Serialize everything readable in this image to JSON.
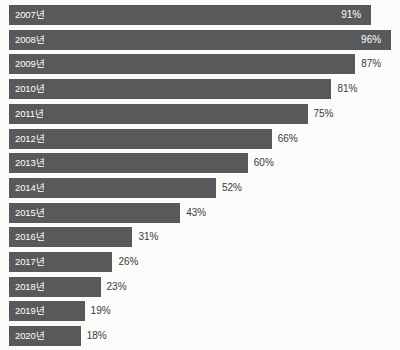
{
  "chart_data": {
    "type": "bar",
    "orientation": "horizontal",
    "title": "",
    "subtitle": "",
    "xlabel": "",
    "ylabel": "",
    "xlim": [
      0,
      100
    ],
    "grid": false,
    "legend": null,
    "legend_position": "none",
    "unit": "%",
    "bar_color": "#58595b",
    "background_color": "#fbfbfa",
    "label_text_color": "#ffffff",
    "value_text_color": "#3a3a3a",
    "categories": [
      "2007년",
      "2008년",
      "2009년",
      "2010년",
      "2011년",
      "2012년",
      "2013년",
      "2014년",
      "2015년",
      "2016년",
      "2017년",
      "2018년",
      "2019년",
      "2020년"
    ],
    "values": [
      91,
      96,
      87,
      81,
      75,
      66,
      60,
      52,
      43,
      31,
      26,
      23,
      19,
      18
    ],
    "value_labels": [
      "91%",
      "96%",
      "87%",
      "81%",
      "75%",
      "66%",
      "60%",
      "52%",
      "43%",
      "31%",
      "26%",
      "23%",
      "19%",
      "18%"
    ],
    "value_label_placement": [
      "inside",
      "inside",
      "outside",
      "outside",
      "outside",
      "outside",
      "outside",
      "outside",
      "outside",
      "outside",
      "outside",
      "outside",
      "outside",
      "outside"
    ]
  }
}
